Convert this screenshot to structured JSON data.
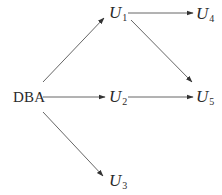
{
  "diagram": {
    "type": "directed-graph",
    "nodes": [
      {
        "id": "DBA",
        "label": "DBA",
        "x": 27,
        "y": 97
      },
      {
        "id": "U1",
        "label": "U",
        "sub": "1",
        "x": 117,
        "y": 13
      },
      {
        "id": "U2",
        "label": "U",
        "sub": "2",
        "x": 117,
        "y": 97
      },
      {
        "id": "U3",
        "label": "U",
        "sub": "3",
        "x": 117,
        "y": 181
      },
      {
        "id": "U4",
        "label": "U",
        "sub": "4",
        "x": 204,
        "y": 13
      },
      {
        "id": "U5",
        "label": "U",
        "sub": "5",
        "x": 204,
        "y": 97
      }
    ],
    "edges": [
      {
        "from": "DBA",
        "to": "U1",
        "x1": 43,
        "y1": 82,
        "x2": 104,
        "y2": 18
      },
      {
        "from": "DBA",
        "to": "U2",
        "x1": 43,
        "y1": 97,
        "x2": 105,
        "y2": 97
      },
      {
        "from": "DBA",
        "to": "U3",
        "x1": 43,
        "y1": 112,
        "x2": 103,
        "y2": 176
      },
      {
        "from": "U1",
        "to": "U4",
        "x1": 128,
        "y1": 13,
        "x2": 193,
        "y2": 13
      },
      {
        "from": "U1",
        "to": "U5",
        "x1": 131,
        "y1": 20,
        "x2": 192,
        "y2": 82
      },
      {
        "from": "U2",
        "to": "U5",
        "x1": 128,
        "y1": 97,
        "x2": 193,
        "y2": 97
      }
    ],
    "colors": {
      "edge": "#555555",
      "text": "#2a2a2a",
      "background": "#ffffff"
    }
  },
  "labels": {
    "dba": "DBA",
    "u": "U",
    "u1_sub": "1",
    "u2_sub": "2",
    "u3_sub": "3",
    "u4_sub": "4",
    "u5_sub": "5"
  }
}
